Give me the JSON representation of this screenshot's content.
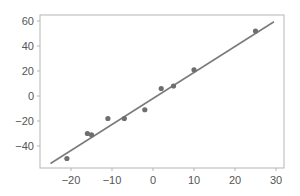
{
  "chart_data": {
    "type": "scatter",
    "title": "",
    "xlabel": "",
    "ylabel": "",
    "xlim": [
      -27,
      32
    ],
    "ylim": [
      -58,
      65
    ],
    "grid": false,
    "legend": null,
    "x_ticks": [
      -20,
      -10,
      0,
      10,
      20,
      30
    ],
    "x_tick_labels": [
      "−20",
      "−10",
      "0",
      "10",
      "20",
      "30"
    ],
    "y_ticks": [
      -40,
      -20,
      0,
      20,
      40,
      60
    ],
    "y_tick_labels": [
      "−40",
      "−20",
      "0",
      "20",
      "40",
      "60"
    ],
    "series": [
      {
        "name": "observations",
        "kind": "scatter",
        "points": [
          {
            "x": -21,
            "y": -50
          },
          {
            "x": -16,
            "y": -30
          },
          {
            "x": -15,
            "y": -31
          },
          {
            "x": -11,
            "y": -18
          },
          {
            "x": -7,
            "y": -18
          },
          {
            "x": -2,
            "y": -11
          },
          {
            "x": 2,
            "y": 6
          },
          {
            "x": 5,
            "y": 8
          },
          {
            "x": 10,
            "y": 21
          },
          {
            "x": 25,
            "y": 52
          }
        ]
      },
      {
        "name": "fit line",
        "kind": "line",
        "points": [
          {
            "x": -25,
            "y": -54
          },
          {
            "x": 29.5,
            "y": 59.4
          }
        ]
      }
    ]
  },
  "colors": {
    "marker": "#6e6e6e",
    "line": "#7a7a7a",
    "axis": "#b5b5b5",
    "tick_label": "#555555"
  }
}
